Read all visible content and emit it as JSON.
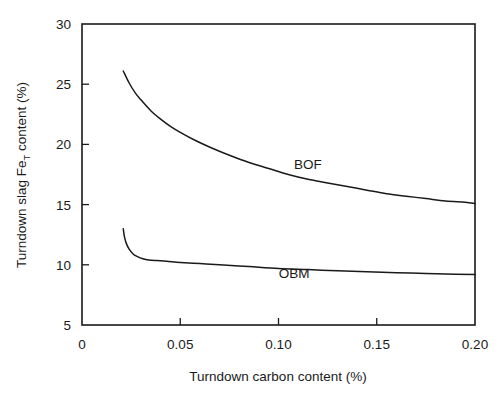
{
  "chart_data": {
    "type": "line",
    "title": "",
    "xlabel": "Turndown carbon content (%)",
    "ylabel_parts": {
      "before": "Turndown slag Fe",
      "subscript": "T",
      "after": " content  (%)"
    },
    "ylabel": "Turndown slag FeT content (%)",
    "xlim": [
      0,
      0.2
    ],
    "ylim": [
      5,
      30
    ],
    "xticks": [
      0,
      0.05,
      0.1,
      0.15,
      0.2
    ],
    "xtick_labels": [
      "0",
      "0.05",
      "0.10",
      "0.15",
      "0.20"
    ],
    "yticks": [
      5,
      10,
      15,
      20,
      25,
      30
    ],
    "ytick_labels": [
      "5",
      "10",
      "15",
      "20",
      "25",
      "30"
    ],
    "grid": false,
    "legend_position": "inline-annotation",
    "tick_direction": "in",
    "series": [
      {
        "name": "BOF",
        "label": "BOF",
        "annotation_x": 0.115,
        "annotation_y": 18.0,
        "x": [
          0.021,
          0.024,
          0.027,
          0.03,
          0.035,
          0.04,
          0.045,
          0.05,
          0.058,
          0.066,
          0.075,
          0.085,
          0.095,
          0.105,
          0.115,
          0.125,
          0.135,
          0.145,
          0.155,
          0.165,
          0.175,
          0.185,
          0.195,
          0.2
        ],
        "y": [
          26.1,
          25.1,
          24.3,
          23.7,
          22.8,
          22.1,
          21.5,
          21.0,
          20.3,
          19.7,
          19.1,
          18.5,
          18.0,
          17.5,
          17.1,
          16.8,
          16.5,
          16.2,
          15.9,
          15.7,
          15.5,
          15.3,
          15.2,
          15.1
        ]
      },
      {
        "name": "OBM",
        "label": "OBM",
        "annotation_x": 0.108,
        "annotation_y": 8.9,
        "x": [
          0.021,
          0.0215,
          0.0225,
          0.024,
          0.026,
          0.028,
          0.031,
          0.034,
          0.038,
          0.043,
          0.05,
          0.06,
          0.07,
          0.085,
          0.1,
          0.115,
          0.13,
          0.145,
          0.16,
          0.175,
          0.19,
          0.2
        ],
        "y": [
          13.0,
          12.4,
          11.8,
          11.3,
          10.9,
          10.7,
          10.5,
          10.4,
          10.35,
          10.3,
          10.2,
          10.1,
          10.0,
          9.85,
          9.7,
          9.6,
          9.5,
          9.42,
          9.35,
          9.28,
          9.22,
          9.2
        ]
      }
    ]
  },
  "plot_geometry": {
    "left": 82,
    "right": 475,
    "top": 24,
    "bottom": 325
  },
  "colors": {
    "line": "#1a1a1a",
    "background": "#ffffff",
    "text": "#1a1a1a"
  }
}
